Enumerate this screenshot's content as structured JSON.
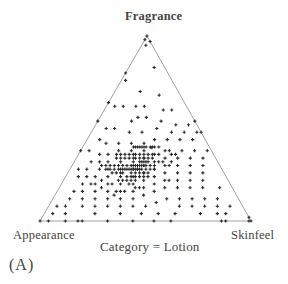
{
  "figure": {
    "panel_label": "(A)",
    "caption": "Category = Lotion"
  },
  "chart_data": {
    "type": "scatter",
    "subtype": "ternary",
    "title": "Category = Lotion",
    "panel": "(A)",
    "axes": {
      "top": "Fragrance",
      "left": "Appearance",
      "right": "Skinfeel"
    },
    "marker": "+",
    "grid": false,
    "legend": null,
    "point_format": [
      "appearance",
      "skinfeel",
      "fragrance"
    ],
    "points": [
      [
        0.0,
        0.0,
        1.0
      ],
      [
        0.02,
        0.0,
        0.98
      ],
      [
        0.0,
        0.03,
        0.97
      ],
      [
        0.03,
        0.02,
        0.95
      ],
      [
        0.05,
        0.12,
        0.83
      ],
      [
        0.2,
        0.0,
        0.8
      ],
      [
        0.22,
        0.02,
        0.76
      ],
      [
        0.1,
        0.22,
        0.68
      ],
      [
        0.18,
        0.12,
        0.7
      ],
      [
        0.2,
        0.18,
        0.62
      ],
      [
        0.12,
        0.28,
        0.6
      ],
      [
        0.08,
        0.32,
        0.6
      ],
      [
        0.24,
        0.14,
        0.62
      ],
      [
        0.3,
        0.08,
        0.62
      ],
      [
        0.36,
        0.0,
        0.64
      ],
      [
        0.34,
        0.04,
        0.62
      ],
      [
        0.22,
        0.22,
        0.56
      ],
      [
        0.26,
        0.18,
        0.56
      ],
      [
        0.16,
        0.3,
        0.54
      ],
      [
        0.1,
        0.38,
        0.52
      ],
      [
        0.04,
        0.44,
        0.52
      ],
      [
        0.0,
        0.46,
        0.54
      ],
      [
        0.3,
        0.16,
        0.54
      ],
      [
        0.28,
        0.24,
        0.48
      ],
      [
        0.34,
        0.18,
        0.48
      ],
      [
        0.4,
        0.1,
        0.5
      ],
      [
        0.44,
        0.06,
        0.5
      ],
      [
        0.46,
        0.0,
        0.54
      ],
      [
        0.2,
        0.3,
        0.5
      ],
      [
        0.14,
        0.38,
        0.48
      ],
      [
        0.08,
        0.44,
        0.48
      ],
      [
        0.02,
        0.5,
        0.48
      ],
      [
        0.0,
        0.52,
        0.48
      ],
      [
        0.24,
        0.32,
        0.44
      ],
      [
        0.3,
        0.28,
        0.42
      ],
      [
        0.36,
        0.22,
        0.42
      ],
      [
        0.42,
        0.16,
        0.42
      ],
      [
        0.48,
        0.1,
        0.42
      ],
      [
        0.5,
        0.06,
        0.44
      ],
      [
        0.18,
        0.38,
        0.44
      ],
      [
        0.12,
        0.44,
        0.44
      ],
      [
        0.06,
        0.5,
        0.44
      ],
      [
        0.26,
        0.34,
        0.4
      ],
      [
        0.32,
        0.3,
        0.38
      ],
      [
        0.38,
        0.24,
        0.38
      ],
      [
        0.44,
        0.18,
        0.38
      ],
      [
        0.5,
        0.14,
        0.36
      ],
      [
        0.54,
        0.1,
        0.36
      ],
      [
        0.58,
        0.04,
        0.38
      ],
      [
        0.62,
        0.0,
        0.38
      ],
      [
        0.2,
        0.42,
        0.38
      ],
      [
        0.14,
        0.48,
        0.38
      ],
      [
        0.08,
        0.54,
        0.38
      ],
      [
        0.02,
        0.6,
        0.38
      ],
      [
        0.28,
        0.36,
        0.36
      ],
      [
        0.34,
        0.32,
        0.34
      ],
      [
        0.4,
        0.28,
        0.32
      ],
      [
        0.46,
        0.22,
        0.32
      ],
      [
        0.52,
        0.16,
        0.32
      ],
      [
        0.56,
        0.12,
        0.32
      ],
      [
        0.6,
        0.08,
        0.32
      ],
      [
        0.24,
        0.42,
        0.34
      ],
      [
        0.18,
        0.48,
        0.34
      ],
      [
        0.12,
        0.54,
        0.34
      ],
      [
        0.06,
        0.6,
        0.34
      ],
      [
        0.3,
        0.38,
        0.32
      ],
      [
        0.36,
        0.34,
        0.3
      ],
      [
        0.42,
        0.3,
        0.28
      ],
      [
        0.48,
        0.24,
        0.28
      ],
      [
        0.54,
        0.18,
        0.28
      ],
      [
        0.58,
        0.14,
        0.28
      ],
      [
        0.64,
        0.08,
        0.28
      ],
      [
        0.68,
        0.04,
        0.28
      ],
      [
        0.26,
        0.44,
        0.3
      ],
      [
        0.2,
        0.5,
        0.3
      ],
      [
        0.14,
        0.56,
        0.3
      ],
      [
        0.08,
        0.62,
        0.3
      ],
      [
        0.32,
        0.4,
        0.28
      ],
      [
        0.38,
        0.36,
        0.26
      ],
      [
        0.44,
        0.32,
        0.24
      ],
      [
        0.5,
        0.26,
        0.24
      ],
      [
        0.56,
        0.2,
        0.24
      ],
      [
        0.62,
        0.14,
        0.24
      ],
      [
        0.66,
        0.1,
        0.24
      ],
      [
        0.7,
        0.06,
        0.24
      ],
      [
        0.28,
        0.46,
        0.26
      ],
      [
        0.22,
        0.52,
        0.26
      ],
      [
        0.16,
        0.58,
        0.26
      ],
      [
        0.1,
        0.64,
        0.26
      ],
      [
        0.34,
        0.42,
        0.24
      ],
      [
        0.4,
        0.38,
        0.22
      ],
      [
        0.46,
        0.34,
        0.2
      ],
      [
        0.52,
        0.28,
        0.2
      ],
      [
        0.58,
        0.22,
        0.2
      ],
      [
        0.64,
        0.16,
        0.2
      ],
      [
        0.7,
        0.1,
        0.2
      ],
      [
        0.3,
        0.48,
        0.22
      ],
      [
        0.24,
        0.54,
        0.22
      ],
      [
        0.18,
        0.6,
        0.22
      ],
      [
        0.12,
        0.66,
        0.22
      ],
      [
        0.36,
        0.44,
        0.2
      ],
      [
        0.42,
        0.4,
        0.18
      ],
      [
        0.48,
        0.36,
        0.16
      ],
      [
        0.54,
        0.3,
        0.16
      ],
      [
        0.6,
        0.24,
        0.16
      ],
      [
        0.66,
        0.18,
        0.16
      ],
      [
        0.72,
        0.12,
        0.16
      ],
      [
        0.76,
        0.08,
        0.16
      ],
      [
        0.32,
        0.5,
        0.18
      ],
      [
        0.26,
        0.56,
        0.18
      ],
      [
        0.2,
        0.62,
        0.18
      ],
      [
        0.14,
        0.68,
        0.18
      ],
      [
        0.06,
        0.76,
        0.18
      ],
      [
        0.38,
        0.46,
        0.16
      ],
      [
        0.44,
        0.42,
        0.14
      ],
      [
        0.5,
        0.38,
        0.12
      ],
      [
        0.56,
        0.32,
        0.12
      ],
      [
        0.62,
        0.26,
        0.12
      ],
      [
        0.68,
        0.2,
        0.12
      ],
      [
        0.74,
        0.14,
        0.12
      ],
      [
        0.8,
        0.08,
        0.12
      ],
      [
        0.34,
        0.54,
        0.12
      ],
      [
        0.28,
        0.6,
        0.12
      ],
      [
        0.22,
        0.66,
        0.12
      ],
      [
        0.16,
        0.72,
        0.12
      ],
      [
        0.1,
        0.78,
        0.12
      ],
      [
        0.4,
        0.5,
        0.1
      ],
      [
        0.46,
        0.46,
        0.08
      ],
      [
        0.52,
        0.4,
        0.08
      ],
      [
        0.58,
        0.34,
        0.08
      ],
      [
        0.64,
        0.28,
        0.08
      ],
      [
        0.7,
        0.22,
        0.08
      ],
      [
        0.76,
        0.16,
        0.08
      ],
      [
        0.84,
        0.08,
        0.08
      ],
      [
        0.88,
        0.04,
        0.08
      ],
      [
        0.3,
        0.62,
        0.08
      ],
      [
        0.24,
        0.68,
        0.08
      ],
      [
        0.18,
        0.74,
        0.08
      ],
      [
        0.12,
        0.8,
        0.08
      ],
      [
        0.06,
        0.86,
        0.08
      ],
      [
        0.42,
        0.54,
        0.04
      ],
      [
        0.5,
        0.46,
        0.04
      ],
      [
        0.6,
        0.36,
        0.04
      ],
      [
        0.72,
        0.24,
        0.04
      ],
      [
        0.86,
        0.1,
        0.04
      ],
      [
        0.92,
        0.04,
        0.04
      ],
      [
        0.34,
        0.62,
        0.04
      ],
      [
        0.22,
        0.74,
        0.04
      ],
      [
        0.14,
        0.82,
        0.04
      ],
      [
        0.1,
        0.86,
        0.04
      ],
      [
        1.0,
        0.0,
        0.0
      ],
      [
        0.96,
        0.04,
        0.0
      ],
      [
        0.88,
        0.12,
        0.0
      ],
      [
        0.82,
        0.18,
        0.0
      ],
      [
        0.8,
        0.2,
        0.0
      ],
      [
        0.68,
        0.32,
        0.0
      ],
      [
        0.56,
        0.44,
        0.0
      ],
      [
        0.46,
        0.54,
        0.0
      ],
      [
        0.38,
        0.62,
        0.0
      ],
      [
        0.14,
        0.86,
        0.0
      ],
      [
        0.12,
        0.88,
        0.0
      ],
      [
        0.0,
        1.0,
        0.0
      ],
      [
        0.01,
        0.99,
        0.0
      ],
      [
        0.0,
        0.98,
        0.02
      ],
      [
        0.36,
        0.32,
        0.32
      ],
      [
        0.34,
        0.34,
        0.32
      ],
      [
        0.35,
        0.33,
        0.32
      ],
      [
        0.33,
        0.35,
        0.32
      ],
      [
        0.37,
        0.31,
        0.32
      ],
      [
        0.32,
        0.34,
        0.34
      ],
      [
        0.34,
        0.32,
        0.34
      ],
      [
        0.36,
        0.3,
        0.34
      ],
      [
        0.3,
        0.36,
        0.34
      ],
      [
        0.38,
        0.28,
        0.34
      ],
      [
        0.33,
        0.31,
        0.36
      ],
      [
        0.35,
        0.29,
        0.36
      ],
      [
        0.31,
        0.33,
        0.36
      ],
      [
        0.37,
        0.27,
        0.36
      ],
      [
        0.29,
        0.35,
        0.36
      ],
      [
        0.36,
        0.36,
        0.28
      ],
      [
        0.34,
        0.38,
        0.28
      ],
      [
        0.38,
        0.34,
        0.28
      ],
      [
        0.32,
        0.4,
        0.28
      ],
      [
        0.4,
        0.32,
        0.28
      ],
      [
        0.35,
        0.35,
        0.3
      ],
      [
        0.33,
        0.37,
        0.3
      ],
      [
        0.37,
        0.33,
        0.3
      ],
      [
        0.31,
        0.39,
        0.3
      ],
      [
        0.39,
        0.31,
        0.3
      ],
      [
        0.42,
        0.32,
        0.26
      ],
      [
        0.4,
        0.34,
        0.26
      ],
      [
        0.38,
        0.36,
        0.26
      ],
      [
        0.44,
        0.3,
        0.26
      ],
      [
        0.36,
        0.38,
        0.26
      ],
      [
        0.41,
        0.35,
        0.24
      ],
      [
        0.39,
        0.37,
        0.24
      ],
      [
        0.43,
        0.33,
        0.24
      ],
      [
        0.37,
        0.39,
        0.24
      ],
      [
        0.45,
        0.31,
        0.24
      ],
      [
        0.44,
        0.26,
        0.3
      ],
      [
        0.46,
        0.24,
        0.3
      ],
      [
        0.42,
        0.28,
        0.3
      ],
      [
        0.48,
        0.22,
        0.3
      ],
      [
        0.4,
        0.3,
        0.3
      ],
      [
        0.45,
        0.27,
        0.28
      ],
      [
        0.47,
        0.25,
        0.28
      ],
      [
        0.43,
        0.29,
        0.28
      ],
      [
        0.49,
        0.23,
        0.28
      ],
      [
        0.41,
        0.31,
        0.28
      ],
      [
        0.48,
        0.3,
        0.22
      ],
      [
        0.46,
        0.32,
        0.22
      ],
      [
        0.5,
        0.28,
        0.22
      ],
      [
        0.44,
        0.34,
        0.22
      ],
      [
        0.52,
        0.26,
        0.22
      ],
      [
        0.4,
        0.24,
        0.36
      ],
      [
        0.42,
        0.22,
        0.36
      ],
      [
        0.38,
        0.26,
        0.36
      ],
      [
        0.44,
        0.2,
        0.36
      ],
      [
        0.46,
        0.18,
        0.36
      ],
      [
        0.43,
        0.23,
        0.34
      ],
      [
        0.41,
        0.25,
        0.34
      ],
      [
        0.45,
        0.21,
        0.34
      ],
      [
        0.39,
        0.27,
        0.34
      ],
      [
        0.47,
        0.19,
        0.34
      ],
      [
        0.5,
        0.2,
        0.3
      ],
      [
        0.52,
        0.18,
        0.3
      ],
      [
        0.54,
        0.16,
        0.3
      ],
      [
        0.56,
        0.14,
        0.3
      ],
      [
        0.51,
        0.21,
        0.28
      ],
      [
        0.53,
        0.19,
        0.28
      ],
      [
        0.55,
        0.17,
        0.28
      ],
      [
        0.49,
        0.25,
        0.26
      ],
      [
        0.51,
        0.23,
        0.26
      ],
      [
        0.53,
        0.21,
        0.26
      ],
      [
        0.3,
        0.3,
        0.4
      ],
      [
        0.32,
        0.28,
        0.4
      ],
      [
        0.34,
        0.26,
        0.4
      ],
      [
        0.28,
        0.32,
        0.4
      ],
      [
        0.36,
        0.24,
        0.4
      ],
      [
        0.31,
        0.29,
        0.4
      ],
      [
        0.33,
        0.27,
        0.4
      ],
      [
        0.29,
        0.31,
        0.42
      ],
      [
        0.35,
        0.25,
        0.4
      ],
      [
        0.27,
        0.33,
        0.4
      ],
      [
        0.46,
        0.26,
        0.28
      ],
      [
        0.48,
        0.26,
        0.26
      ],
      [
        0.47,
        0.29,
        0.24
      ],
      [
        0.44,
        0.28,
        0.28
      ],
      [
        0.42,
        0.3,
        0.28
      ],
      [
        0.38,
        0.32,
        0.3
      ],
      [
        0.36,
        0.34,
        0.3
      ],
      [
        0.4,
        0.32,
        0.28
      ],
      [
        0.39,
        0.33,
        0.28
      ],
      [
        0.41,
        0.29,
        0.3
      ],
      [
        0.52,
        0.32,
        0.16
      ],
      [
        0.56,
        0.28,
        0.16
      ],
      [
        0.48,
        0.32,
        0.2
      ],
      [
        0.46,
        0.36,
        0.18
      ],
      [
        0.44,
        0.38,
        0.18
      ],
      [
        0.28,
        0.4,
        0.32
      ],
      [
        0.26,
        0.38,
        0.36
      ],
      [
        0.24,
        0.36,
        0.4
      ],
      [
        0.22,
        0.4,
        0.38
      ],
      [
        0.26,
        0.42,
        0.32
      ],
      [
        0.22,
        0.46,
        0.32
      ],
      [
        0.2,
        0.44,
        0.36
      ],
      [
        0.18,
        0.46,
        0.36
      ],
      [
        0.24,
        0.46,
        0.3
      ],
      [
        0.28,
        0.5,
        0.22
      ],
      [
        0.58,
        0.28,
        0.14
      ],
      [
        0.62,
        0.2,
        0.18
      ],
      [
        0.66,
        0.14,
        0.2
      ],
      [
        0.6,
        0.18,
        0.22
      ],
      [
        0.56,
        0.24,
        0.2
      ]
    ]
  }
}
